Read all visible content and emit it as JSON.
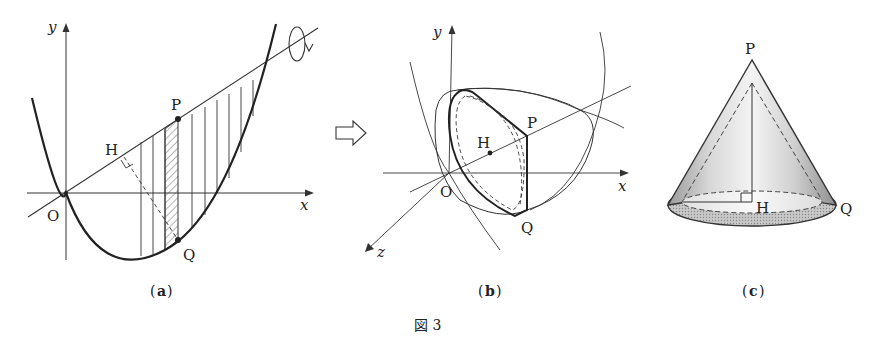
{
  "figure": {
    "caption": "図 3",
    "panels": [
      {
        "id": "a",
        "caption_open": "(",
        "caption_letter": "a",
        "caption_close": ")",
        "labels": {
          "y": "y",
          "x": "x",
          "O": "O",
          "H": "H",
          "P": "P",
          "Q": "Q"
        }
      },
      {
        "id": "b",
        "caption_open": "(",
        "caption_letter": "b",
        "caption_close": ")",
        "labels": {
          "y": "y",
          "x": "x",
          "z": "z",
          "O": "O",
          "H": "H",
          "P": "P",
          "Q": "Q"
        }
      },
      {
        "id": "c",
        "caption_open": "(",
        "caption_letter": "c",
        "caption_close": ")",
        "labels": {
          "P": "P",
          "H": "H",
          "Q": "Q"
        }
      }
    ],
    "arrow_icon": "right-outline-arrow-icon",
    "rotation_icon": "rotation-arrow-icon"
  }
}
